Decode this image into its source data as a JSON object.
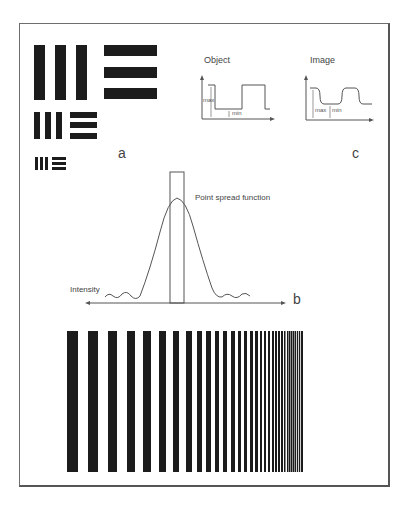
{
  "panels": {
    "a": {
      "label": "a",
      "groups": [
        {
          "size": "large",
          "vertical_bars": [
            [
              34,
              45,
              11,
              55
            ],
            [
              55,
              45,
              11,
              55
            ],
            [
              76,
              45,
              11,
              55
            ]
          ],
          "horizontal_bars": [
            [
              104,
              45,
              53,
              11
            ],
            [
              104,
              67,
              53,
              11
            ],
            [
              104,
              88,
              53,
              11
            ]
          ]
        },
        {
          "size": "medium",
          "vertical_bars": [
            [
              34,
              112,
              6,
              27
            ],
            [
              45,
              112,
              6,
              27
            ],
            [
              56,
              112,
              6,
              27
            ]
          ],
          "horizontal_bars": [
            [
              70,
              112,
              27,
              6
            ],
            [
              70,
              122,
              27,
              6
            ],
            [
              70,
              133,
              27,
              6
            ]
          ]
        },
        {
          "size": "small",
          "vertical_bars": [
            [
              35,
              157,
              3,
              13
            ],
            [
              40,
              157,
              3,
              13
            ],
            [
              45,
              157,
              3,
              13
            ]
          ],
          "horizontal_bars": [
            [
              52,
              157,
              14,
              3
            ],
            [
              52,
              162,
              14,
              3
            ],
            [
              52,
              167,
              14,
              3
            ]
          ]
        }
      ]
    },
    "b": {
      "label": "b",
      "curve_label": "Point spread function",
      "axis_label": "Intensity"
    },
    "c": {
      "label": "c",
      "object_title": "Object",
      "image_title": "Image",
      "max_label": "max",
      "min_label": "min"
    },
    "grating": {
      "top": 331,
      "bottom": 472,
      "bars": [
        [
          67,
          11
        ],
        [
          88,
          10
        ],
        [
          108,
          9
        ],
        [
          127,
          8
        ],
        [
          143,
          8
        ],
        [
          159,
          7
        ],
        [
          173,
          6
        ],
        [
          186,
          6
        ],
        [
          197,
          5
        ],
        [
          206,
          5
        ],
        [
          215,
          4
        ],
        [
          223,
          4
        ],
        [
          231,
          4
        ],
        [
          238,
          3
        ],
        [
          244,
          3
        ],
        [
          250,
          3
        ],
        [
          255,
          3
        ],
        [
          260,
          2
        ],
        [
          264,
          2
        ],
        [
          268,
          2
        ],
        [
          272,
          2
        ],
        [
          275,
          2
        ],
        [
          278,
          2
        ],
        [
          281,
          2
        ],
        [
          284,
          1.5
        ],
        [
          287,
          1.5
        ],
        [
          289,
          1.5
        ],
        [
          291,
          1.5
        ],
        [
          293,
          1.5
        ],
        [
          295,
          1.2
        ],
        [
          297,
          1.2
        ],
        [
          299,
          1.2
        ],
        [
          301,
          2
        ]
      ]
    }
  },
  "colors": {
    "bar": "#1c1c1c",
    "line": "#555555",
    "frame": "#6e6e6e"
  }
}
